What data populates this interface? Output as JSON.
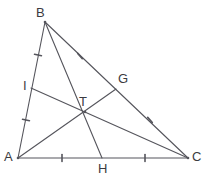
{
  "figure": {
    "kind": "geometry-diagram",
    "background_color": "#ffffff",
    "stroke_color": "#55555c",
    "label_color": "#3b3b41",
    "stroke_width": 1.1,
    "width": 207,
    "height": 185
  },
  "points": {
    "A": {
      "label": "A",
      "x": 18,
      "y": 158,
      "label_x": 4,
      "label_y": 150
    },
    "B": {
      "label": "B",
      "x": 45,
      "y": 22,
      "label_x": 36,
      "label_y": 6
    },
    "C": {
      "label": "C",
      "x": 188,
      "y": 158,
      "label_x": 192,
      "label_y": 150
    },
    "G": {
      "label": "G",
      "x": 116,
      "y": 89,
      "label_x": 118,
      "label_y": 72
    },
    "H": {
      "label": "H",
      "x": 102,
      "y": 158,
      "label_x": 98,
      "label_y": 162
    },
    "I": {
      "label": "I",
      "x": 31,
      "y": 88,
      "label_x": 23,
      "label_y": 79
    },
    "T": {
      "label": "T",
      "x": 85,
      "y": 112,
      "label_x": 79,
      "label_y": 95
    }
  },
  "sides": [
    {
      "name": "side-ab",
      "from": "A",
      "to": "B"
    },
    {
      "name": "side-bc",
      "from": "B",
      "to": "C"
    },
    {
      "name": "side-ac",
      "from": "A",
      "to": "C"
    }
  ],
  "cevians": [
    {
      "name": "median-a-to-g",
      "from": "A",
      "to": "G"
    },
    {
      "name": "median-b-to-h",
      "from": "B",
      "to": "H"
    },
    {
      "name": "median-c-to-i",
      "from": "C",
      "to": "I"
    }
  ],
  "tick_marks": [
    {
      "name": "tick-ab-upper",
      "x": 38,
      "y": 55,
      "angle": 11,
      "length": 7
    },
    {
      "name": "tick-ab-lower",
      "x": 26,
      "y": 120,
      "angle": 11,
      "length": 7
    },
    {
      "name": "tick-bc-upper",
      "x": 80,
      "y": 56,
      "angle": 49,
      "length": 7
    },
    {
      "name": "tick-bc-lower",
      "x": 150,
      "y": 120,
      "angle": 49,
      "length": 7
    },
    {
      "name": "tick-ac-left",
      "x": 62,
      "y": 158,
      "angle": 90,
      "length": 7
    },
    {
      "name": "tick-ac-right",
      "x": 145,
      "y": 158,
      "angle": 90,
      "length": 7
    }
  ]
}
